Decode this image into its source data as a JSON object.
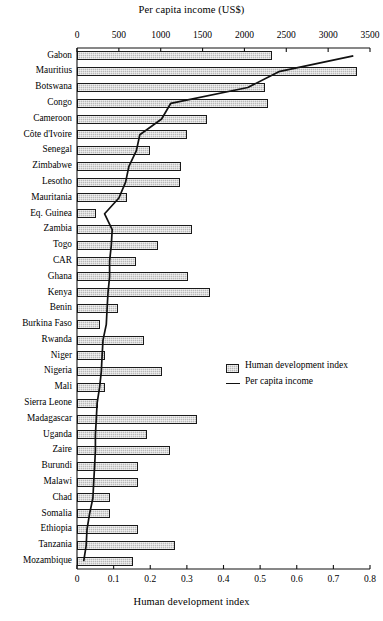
{
  "chart_data": {
    "type": "bar",
    "title": "",
    "top_axis": {
      "label": "Per capita income (US$)",
      "ticks": [
        0,
        500,
        1000,
        1500,
        2000,
        2500,
        3000,
        3500
      ],
      "tick_labels": [
        "0",
        "500",
        "1000",
        "1500",
        "2000",
        "2500",
        "3000",
        "3500"
      ],
      "range": [
        0,
        3500
      ]
    },
    "bottom_axis": {
      "label": "Human development index",
      "ticks": [
        0,
        0.1,
        0.2,
        0.3,
        0.4,
        0.5,
        0.6,
        0.7,
        0.8
      ],
      "tick_labels": [
        "0",
        "0.1",
        "0.2",
        "0.3",
        "0.4",
        "0.5",
        "0.6",
        "0.7",
        "0.8"
      ],
      "range": [
        0,
        0.8
      ]
    },
    "grid": false,
    "legend_position": "center-right",
    "legend": [
      {
        "key": "hdi",
        "label": "Human development index",
        "marker": "hatched-box"
      },
      {
        "key": "pci",
        "label": "Per capita income",
        "marker": "line"
      }
    ],
    "categories": [
      "Gabon",
      "Mauritius",
      "Botswana",
      "Congo",
      "Cameroon",
      "Côte d'Ivoire",
      "Senegal",
      "Zimbabwe",
      "Lesotho",
      "Mauritania",
      "Eq. Guinea",
      "Zambia",
      "Togo",
      "CAR",
      "Ghana",
      "Kenya",
      "Benin",
      "Burkina Faso",
      "Rwanda",
      "Niger",
      "Nigeria",
      "Mali",
      "Sierra Leone",
      "Madagascar",
      "Uganda",
      "Zaire",
      "Burundi",
      "Malawi",
      "Chad",
      "Somalia",
      "Ethiopia",
      "Tanzania",
      "Mozambique"
    ],
    "series": [
      {
        "name": "Human development index",
        "axis": "bottom",
        "values": [
          0.533,
          0.765,
          0.512,
          0.521,
          0.355,
          0.3,
          0.2,
          0.284,
          0.282,
          0.137,
          0.052,
          0.314,
          0.221,
          0.161,
          0.303,
          0.363,
          0.111,
          0.063,
          0.183,
          0.076,
          0.232,
          0.076,
          0.057,
          0.327,
          0.191,
          0.254,
          0.167,
          0.167,
          0.09,
          0.09,
          0.167,
          0.268,
          0.153
        ]
      },
      {
        "name": "Per capita income",
        "axis": "top",
        "values": [
          3300,
          2410,
          2040,
          1120,
          1010,
          750,
          710,
          620,
          580,
          500,
          330,
          420,
          410,
          390,
          390,
          370,
          360,
          350,
          310,
          300,
          290,
          270,
          240,
          230,
          220,
          220,
          210,
          200,
          190,
          150,
          120,
          110,
          80
        ]
      }
    ]
  }
}
